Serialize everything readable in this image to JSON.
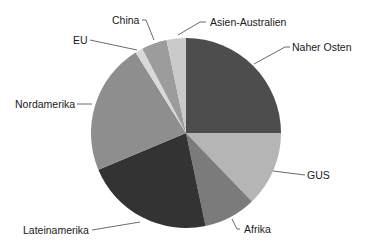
{
  "chart_data": {
    "type": "pie",
    "title": "",
    "start_angle_deg": 0,
    "direction": "clockwise",
    "center": [
      186,
      133
    ],
    "radius": 95,
    "slices": [
      {
        "label": "Naher Osten",
        "value": 25.0,
        "color": "#4d4d4d"
      },
      {
        "label": "GUS",
        "value": 12.8,
        "color": "#b5b5b5"
      },
      {
        "label": "Afrika",
        "value": 8.9,
        "color": "#7b7b7b"
      },
      {
        "label": "Lateinamerika",
        "value": 22.0,
        "color": "#333333"
      },
      {
        "label": "Nordamerika",
        "value": 22.4,
        "color": "#8e8e8e"
      },
      {
        "label": "EU",
        "value": 1.3,
        "color": "#d9d9d9"
      },
      {
        "label": "China",
        "value": 4.3,
        "color": "#9c9c9c"
      },
      {
        "label": "Asien-Australien",
        "value": 3.3,
        "color": "#cacaca"
      }
    ],
    "legend": "none (direct leader-line labels)"
  },
  "labels": {
    "naher_osten": "Naher Osten",
    "gus": "GUS",
    "afrika": "Afrika",
    "lateinamerika": "Lateinamerika",
    "nordamerika": "Nordamerika",
    "eu": "EU",
    "china": "China",
    "asien_australien": "Asien-Australien"
  }
}
